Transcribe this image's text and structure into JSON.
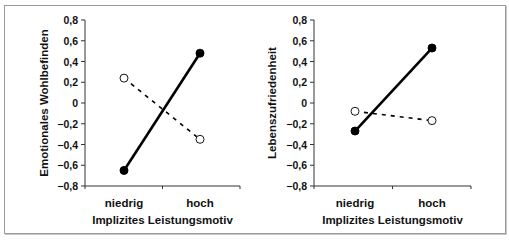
{
  "chart_data": [
    {
      "type": "line",
      "title": "",
      "xlabel": "Implizites Leistungsmotiv",
      "ylabel": "Emotionales Wohlbefinden",
      "categories": [
        "niedrig",
        "hoch"
      ],
      "ylim": [
        -0.8,
        0.8
      ],
      "yticks": [
        "0,8",
        "0,6",
        "0,4",
        "0,2",
        "0",
        "-0,2",
        "-0,4",
        "-0,6",
        "-0,8"
      ],
      "grid": false,
      "legend": "none",
      "series": [
        {
          "name": "solid-filled-markers",
          "style": "solid",
          "marker": "filled-circle",
          "values": [
            -0.65,
            0.48
          ]
        },
        {
          "name": "dashed-open-markers",
          "style": "dashed",
          "marker": "open-circle",
          "values": [
            0.24,
            -0.35
          ]
        }
      ]
    },
    {
      "type": "line",
      "title": "",
      "xlabel": "Implizites Leistungsmotiv",
      "ylabel": "Lebenszufriedenheit",
      "categories": [
        "niedrig",
        "hoch"
      ],
      "ylim": [
        -0.8,
        0.8
      ],
      "yticks": [
        "0,8",
        "0,6",
        "0,4",
        "0,2",
        "0",
        "-0,2",
        "-0,4",
        "-0,6",
        "-0,8"
      ],
      "grid": false,
      "legend": "none",
      "series": [
        {
          "name": "solid-filled-markers",
          "style": "solid",
          "marker": "filled-circle",
          "values": [
            -0.27,
            0.53
          ]
        },
        {
          "name": "dashed-open-markers",
          "style": "dashed",
          "marker": "open-circle",
          "values": [
            -0.08,
            -0.17
          ]
        }
      ]
    }
  ],
  "colors": {
    "line": "#000000",
    "axis": "#333333",
    "frame": "#9a9a9a"
  }
}
